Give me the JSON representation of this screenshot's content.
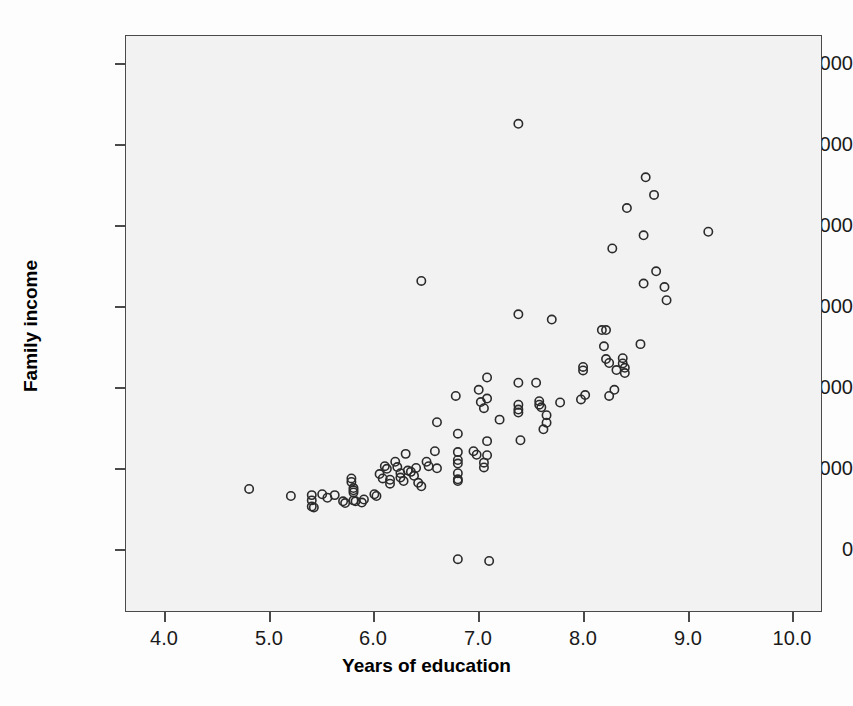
{
  "chart_data": {
    "type": "scatter",
    "title": "",
    "xlabel": "Years of education",
    "ylabel": "Family income",
    "xlim": [
      3.62,
      10.28
    ],
    "ylim": [
      -390,
      6160
    ],
    "xticks": [
      4.0,
      5.0,
      6.0,
      7.0,
      8.0,
      9.0,
      10.0
    ],
    "xtick_labels": [
      "4.0",
      "5.0",
      "6.0",
      "7.0",
      "8.0",
      "9.0",
      "10.0"
    ],
    "yticks": [
      0,
      1000,
      2000,
      3000,
      4000,
      5000,
      6000
    ],
    "ytick_labels": [
      "0",
      "1000",
      "2000",
      "3000",
      "4000",
      "5000",
      "6000"
    ],
    "grid": false,
    "legend": null,
    "marker": "open-circle",
    "marker_color": "#2b2b2b",
    "plot_background": "#f2f2f2",
    "n_points": 104,
    "points": [
      [
        4.8,
        1000
      ],
      [
        5.2,
        920
      ],
      [
        5.4,
        930
      ],
      [
        5.4,
        870
      ],
      [
        5.4,
        800
      ],
      [
        5.42,
        790
      ],
      [
        5.5,
        940
      ],
      [
        5.55,
        900
      ],
      [
        5.62,
        930
      ],
      [
        5.7,
        860
      ],
      [
        5.72,
        840
      ],
      [
        5.78,
        1120
      ],
      [
        5.78,
        1080
      ],
      [
        5.8,
        1010
      ],
      [
        5.8,
        985
      ],
      [
        5.8,
        960
      ],
      [
        5.8,
        870
      ],
      [
        5.82,
        860
      ],
      [
        5.88,
        845
      ],
      [
        5.9,
        880
      ],
      [
        6.0,
        940
      ],
      [
        6.02,
        920
      ],
      [
        6.05,
        1170
      ],
      [
        6.08,
        1120
      ],
      [
        6.1,
        1260
      ],
      [
        6.12,
        1230
      ],
      [
        6.15,
        1105
      ],
      [
        6.15,
        1060
      ],
      [
        6.2,
        1310
      ],
      [
        6.22,
        1250
      ],
      [
        6.25,
        1180
      ],
      [
        6.25,
        1130
      ],
      [
        6.28,
        1090
      ],
      [
        6.3,
        1400
      ],
      [
        6.32,
        1210
      ],
      [
        6.35,
        1195
      ],
      [
        6.38,
        1150
      ],
      [
        6.4,
        1240
      ],
      [
        6.42,
        1070
      ],
      [
        6.45,
        1030
      ],
      [
        6.45,
        3370
      ],
      [
        6.5,
        1310
      ],
      [
        6.52,
        1260
      ],
      [
        6.58,
        1430
      ],
      [
        6.6,
        1760
      ],
      [
        6.6,
        1235
      ],
      [
        6.78,
        2060
      ],
      [
        6.8,
        1630
      ],
      [
        6.8,
        1420
      ],
      [
        6.8,
        1330
      ],
      [
        6.8,
        1290
      ],
      [
        6.8,
        1180
      ],
      [
        6.8,
        1110
      ],
      [
        6.8,
        1090
      ],
      [
        6.8,
        200
      ],
      [
        6.95,
        1430
      ],
      [
        6.98,
        1390
      ],
      [
        7.0,
        2130
      ],
      [
        7.02,
        1990
      ],
      [
        7.05,
        1920
      ],
      [
        7.05,
        1300
      ],
      [
        7.05,
        1245
      ],
      [
        7.08,
        2270
      ],
      [
        7.08,
        2030
      ],
      [
        7.08,
        1545
      ],
      [
        7.08,
        1385
      ],
      [
        7.1,
        180
      ],
      [
        7.2,
        1790
      ],
      [
        7.38,
        5160
      ],
      [
        7.38,
        2990
      ],
      [
        7.38,
        2210
      ],
      [
        7.38,
        1960
      ],
      [
        7.38,
        1905
      ],
      [
        7.38,
        1870
      ],
      [
        7.4,
        1555
      ],
      [
        7.55,
        2210
      ],
      [
        7.58,
        2000
      ],
      [
        7.58,
        1960
      ],
      [
        7.6,
        1930
      ],
      [
        7.62,
        1680
      ],
      [
        7.65,
        1840
      ],
      [
        7.65,
        1755
      ],
      [
        7.7,
        2930
      ],
      [
        7.78,
        1985
      ],
      [
        7.98,
        2020
      ],
      [
        8.0,
        2390
      ],
      [
        8.0,
        2350
      ],
      [
        8.02,
        2070
      ],
      [
        8.18,
        2810
      ],
      [
        8.2,
        2625
      ],
      [
        8.22,
        2480
      ],
      [
        8.22,
        2810
      ],
      [
        8.25,
        2435
      ],
      [
        8.25,
        2060
      ],
      [
        8.28,
        3740
      ],
      [
        8.3,
        2130
      ],
      [
        8.32,
        2355
      ],
      [
        8.38,
        2490
      ],
      [
        8.38,
        2430
      ],
      [
        8.4,
        2380
      ],
      [
        8.4,
        2320
      ],
      [
        8.42,
        4200
      ],
      [
        8.55,
        2650
      ],
      [
        8.58,
        3340
      ],
      [
        8.58,
        3890
      ],
      [
        8.6,
        4550
      ],
      [
        8.68,
        4350
      ],
      [
        8.7,
        3480
      ],
      [
        8.78,
        3300
      ],
      [
        8.8,
        3150
      ],
      [
        9.2,
        3930
      ]
    ]
  },
  "axes": {
    "xaxis_title": "Years of education",
    "yaxis_title": "Family income"
  }
}
